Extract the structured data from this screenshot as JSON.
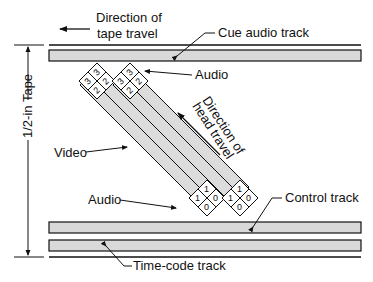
{
  "diagram": {
    "labels": {
      "tape_direction_line1": "Direction of",
      "tape_direction_line2": "tape travel",
      "cue_audio": "Cue audio track",
      "audio_top": "Audio",
      "head_direction_line1": "Direction of",
      "head_direction_line2": "head travel",
      "video": "Video",
      "audio_bottom": "Audio",
      "control": "Control track",
      "timecode": "Time-code track",
      "tape_width": "1/2-in Tape"
    },
    "audio_head_digits": {
      "top": [
        "3",
        "3",
        "2",
        "2"
      ],
      "bottom": [
        "1",
        "1",
        "0",
        "0"
      ]
    },
    "colors": {
      "track_fill": "#d9d9d9",
      "stroke": "#111111",
      "background": "#ffffff"
    }
  }
}
